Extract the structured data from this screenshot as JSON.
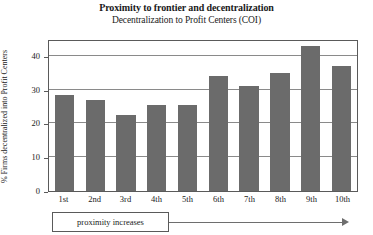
{
  "chart_data": {
    "type": "bar",
    "title": "Proximity to frontier and decentralization",
    "subtitle": "Decentralization to Profit Centers (COI)",
    "xlabel": "",
    "ylabel": "% Firms decentralized into Profit Centers",
    "categories": [
      "1st",
      "2nd",
      "3rd",
      "4th",
      "5th",
      "6th",
      "7th",
      "8th",
      "9th",
      "10th"
    ],
    "values": [
      28.5,
      27,
      22.5,
      25.5,
      25.5,
      34,
      31,
      35,
      43,
      37
    ],
    "ylim": [
      0,
      45
    ],
    "yticks": [
      0,
      10,
      20,
      30,
      40
    ],
    "ytick_labels": [
      "0",
      "10",
      "20",
      "30",
      "40"
    ],
    "grid": true,
    "legend": false,
    "bar_color": "#6b6b6b",
    "annotation": "proximity increases"
  },
  "annotation": {
    "label": "proximity increases",
    "arrow": "right-arrow-icon"
  }
}
